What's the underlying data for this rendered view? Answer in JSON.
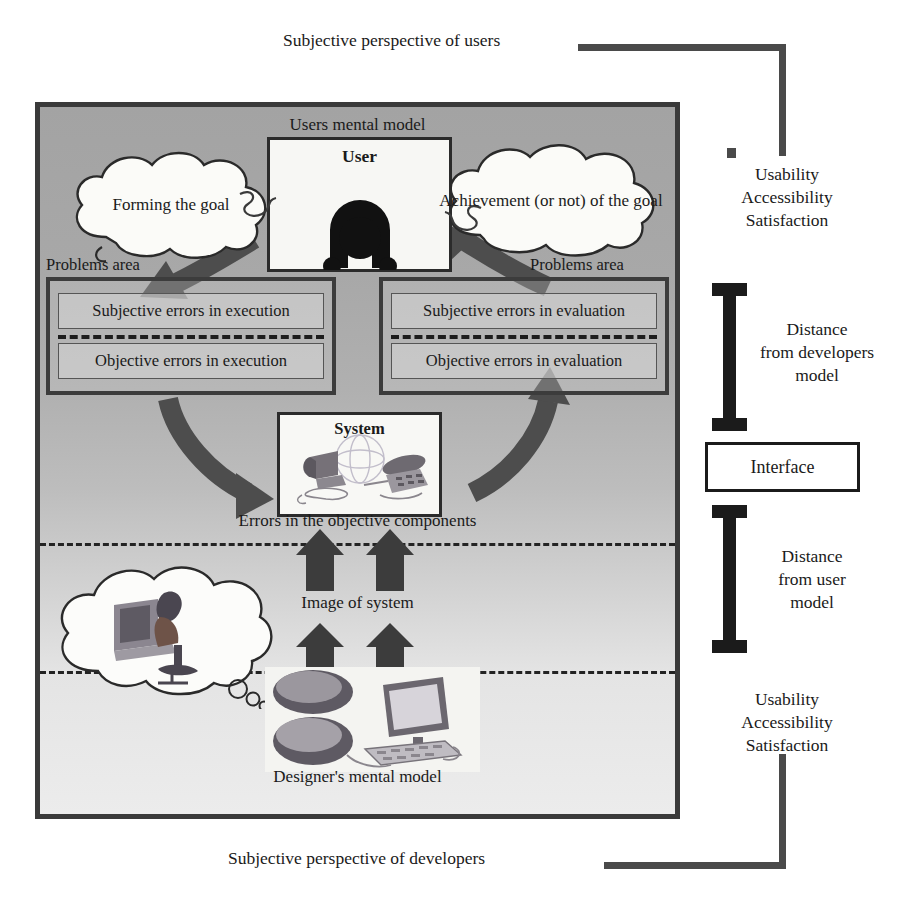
{
  "diagram": {
    "top_label": "Subjective perspective of users",
    "bottom_label": "Subjective perspective of developers",
    "panel": {
      "title": "Users mental model",
      "designer_label": "Designer's mental model",
      "errors_objective_label": "Errors in the objective components",
      "image_of_system_label": "Image of system",
      "problems_area_left": "Problems area",
      "problems_area_right": "Problems area",
      "user_box_label": "User",
      "system_box_label": "System",
      "cloud_left": "Forming the goal",
      "cloud_right": "Achievement (or not)\nof the goal",
      "cloud_designer": "designer-thinking-illustration",
      "errors": {
        "left": {
          "subjective": "Subjective errors in execution",
          "objective": "Objective errors in execution"
        },
        "right": {
          "subjective": "Subjective errors in evaluation",
          "objective": "Objective errors in evaluation"
        }
      }
    },
    "right_column": {
      "qualities_top": "Usability\nAccessibility\nSatisfaction",
      "distance_developers": "Distance\nfrom developers\nmodel",
      "interface": "Interface",
      "distance_user": "Distance\nfrom user\nmodel",
      "qualities_bottom": "Usability\nAccessibility\nSatisfaction"
    },
    "colors": {
      "frame_border": "#3a3a3a",
      "panel_top_gray": "#a3a3a3",
      "panel_bottom_gray": "#ececec",
      "connector": "#4a4a4a",
      "arrow_fill": "#4d4d4d",
      "bracket": "#1b1b1b",
      "text": "#1a1a1a"
    }
  }
}
